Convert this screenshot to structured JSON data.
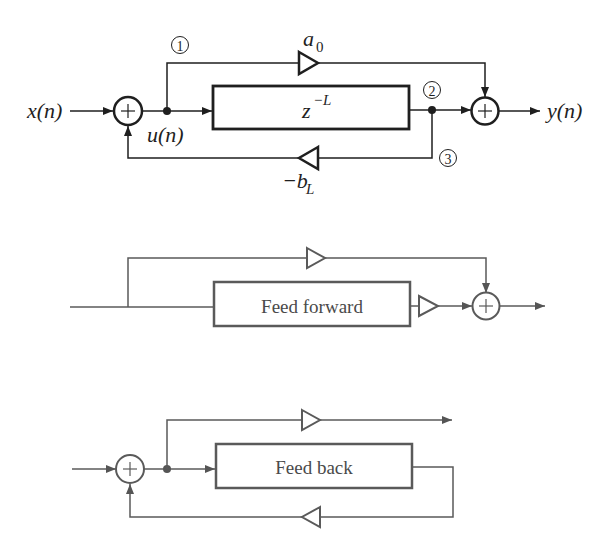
{
  "diagram_1": {
    "title": "Comb filter signal-flow graph",
    "input_label": "x(n)",
    "output_label": "y(n)",
    "node_label": "u(n)",
    "delay_block": {
      "base": "z",
      "exponent": "−L"
    },
    "feedforward_gain": {
      "base": "a",
      "subscript": "0"
    },
    "feedback_gain": {
      "base": "−b",
      "subscript": "L"
    },
    "node_markers": [
      "①",
      "②",
      "③"
    ],
    "adders": [
      "+",
      "+"
    ]
  },
  "diagram_2": {
    "block_label": "Feed forward",
    "adders": [
      "+"
    ]
  },
  "diagram_3": {
    "block_label": "Feed back",
    "adders": [
      "+"
    ]
  },
  "colors": {
    "primary_stroke": "#1f1f1f",
    "secondary_stroke": "#5a5a5a",
    "background": "#ffffff"
  }
}
